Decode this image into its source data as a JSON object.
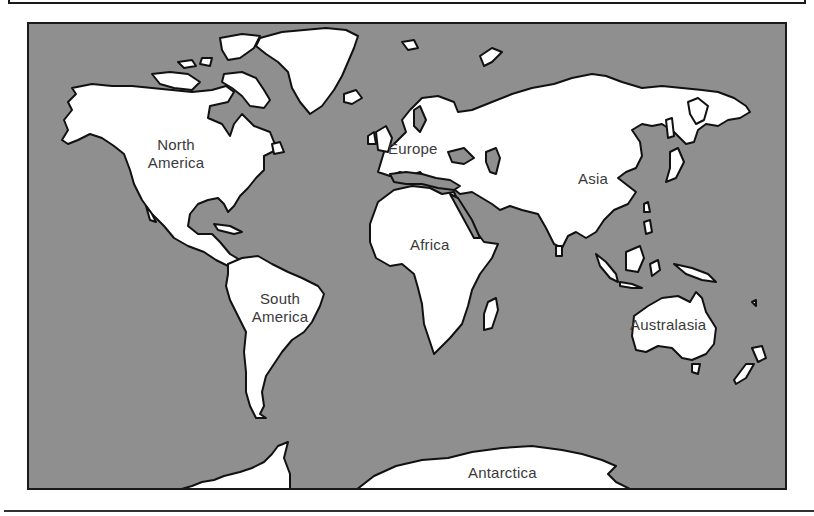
{
  "map": {
    "title": "World continents",
    "colors": {
      "ocean": "#8f8f8f",
      "land": "#ffffff",
      "outline": "#111111",
      "label": "#3a3a3a"
    },
    "labels": {
      "north_america": {
        "line1": "North",
        "line2": "America"
      },
      "south_america": {
        "line1": "South",
        "line2": "America"
      },
      "europe": "Europe",
      "asia": "Asia",
      "africa": "Africa",
      "australasia": "Australasia",
      "antarctica": "Antarctica"
    }
  }
}
